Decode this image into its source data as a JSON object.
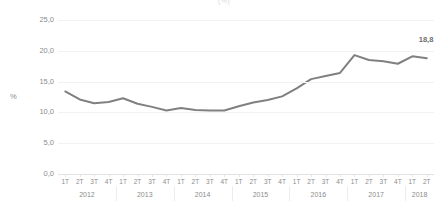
{
  "chart_title": "(%)",
  "axis": {
    "y_label": "%",
    "y_ticks": [
      "0,0",
      "5,0",
      "10,0",
      "15,0",
      "20,0",
      "25,0"
    ],
    "quarter_labels": [
      "1T",
      "2T",
      "3T",
      "4T"
    ],
    "year_labels": [
      "2012",
      "2013",
      "2014",
      "2015",
      "2016",
      "2017",
      "2018"
    ]
  },
  "end_label": "18,8",
  "colors": {
    "series_line": "#808080",
    "gridline": "#f2f2f2",
    "axis_text": "#8c8c8c",
    "label_text": "#6e6e6e"
  },
  "chart_data": {
    "type": "line",
    "title": "(%)",
    "xlabel": "",
    "ylabel": "%",
    "ylim": [
      0,
      25
    ],
    "yticks": [
      0,
      5,
      10,
      15,
      20,
      25
    ],
    "grid": true,
    "legend": "none",
    "categories": [
      "1T 2012",
      "2T 2012",
      "3T 2012",
      "4T 2012",
      "1T 2013",
      "2T 2013",
      "3T 2013",
      "4T 2013",
      "1T 2014",
      "2T 2014",
      "3T 2014",
      "4T 2014",
      "1T 2015",
      "2T 2015",
      "3T 2015",
      "4T 2015",
      "1T 2016",
      "2T 2016",
      "3T 2016",
      "4T 2016",
      "1T 2017",
      "2T 2017",
      "3T 2017",
      "4T 2017",
      "1T 2018",
      "2T 2018"
    ],
    "values": [
      13.4,
      12.1,
      11.5,
      11.7,
      12.3,
      11.4,
      10.9,
      10.3,
      10.7,
      10.4,
      10.3,
      10.3,
      11.0,
      11.6,
      12.0,
      12.6,
      13.9,
      15.4,
      15.9,
      16.4,
      19.3,
      18.5,
      18.3,
      17.9,
      19.1,
      18.8
    ],
    "annotations": [
      {
        "category": "2T 2018",
        "value": 18.8,
        "text": "18,8"
      }
    ]
  }
}
